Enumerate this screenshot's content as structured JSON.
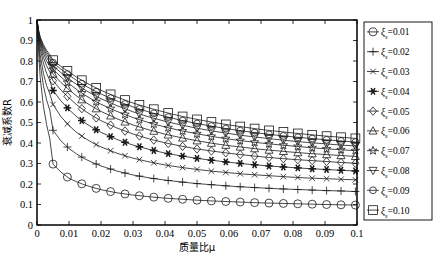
{
  "chart_data": {
    "type": "line",
    "title": "",
    "xlabel": "质量比μ",
    "ylabel": "衰减系数R",
    "xlim": [
      0,
      0.1
    ],
    "ylim": [
      0,
      1
    ],
    "grid": false,
    "legend_position": "right-outside",
    "x_ticks": [
      "0",
      "0.01",
      "0.02",
      "0.03",
      "0.04",
      "0.05",
      "0.06",
      "0.07",
      "0.08",
      "0.09",
      "0.1"
    ],
    "x_tick_values": [
      0,
      0.01,
      0.02,
      0.03,
      0.04,
      0.05,
      0.06,
      0.07,
      0.08,
      0.09,
      0.1
    ],
    "y_ticks": [
      "0",
      "0.1",
      "0.2",
      "0.3",
      "0.4",
      "0.5",
      "0.6",
      "0.7",
      "0.8",
      "0.9",
      "1"
    ],
    "y_tick_values": [
      0,
      0.1,
      0.2,
      0.3,
      0.4,
      0.5,
      0.6,
      0.7,
      0.8,
      0.9,
      1.0
    ],
    "x": [
      0,
      0.0005,
      0.001,
      0.002,
      0.003,
      0.004,
      0.005,
      0.0075,
      0.01,
      0.0125,
      0.015,
      0.0175,
      0.02,
      0.025,
      0.03,
      0.035,
      0.04,
      0.045,
      0.05,
      0.055,
      0.06,
      0.065,
      0.07,
      0.075,
      0.08,
      0.085,
      0.09,
      0.095,
      0.1
    ],
    "marker_x": [
      0.005,
      0.0095,
      0.014,
      0.0185,
      0.023,
      0.0275,
      0.032,
      0.0365,
      0.041,
      0.0455,
      0.05,
      0.0545,
      0.059,
      0.0635,
      0.068,
      0.0725,
      0.077,
      0.0815,
      0.086,
      0.0905,
      0.095,
      0.0995
    ],
    "series": [
      {
        "name": "ξs=0.01",
        "label_prefix": "ξ",
        "label_sub": "s",
        "label_suffix": "=0.01",
        "marker": "circle",
        "filled": false,
        "marker_size": 4.0,
        "values": [
          1.0,
          0.84,
          0.72,
          0.58,
          0.49,
          0.42,
          0.297,
          0.258,
          0.228,
          0.21,
          0.195,
          0.183,
          0.172,
          0.157,
          0.146,
          0.138,
          0.131,
          0.126,
          0.121,
          0.117,
          0.114,
          0.111,
          0.108,
          0.106,
          0.104,
          0.102,
          0.1,
          0.0985,
          0.097
        ]
      },
      {
        "name": "ξs=0.02",
        "label_prefix": "ξ",
        "label_sub": "s",
        "label_suffix": "=0.02",
        "marker": "plus",
        "filled": false,
        "marker_size": 4.0,
        "values": [
          1.0,
          0.88,
          0.79,
          0.68,
          0.61,
          0.56,
          0.462,
          0.41,
          0.373,
          0.345,
          0.322,
          0.304,
          0.288,
          0.263,
          0.244,
          0.23,
          0.219,
          0.21,
          0.202,
          0.196,
          0.19,
          0.185,
          0.181,
          0.177,
          0.174,
          0.171,
          0.168,
          0.166,
          0.163
        ]
      },
      {
        "name": "ξs=0.03",
        "label_prefix": "ξ",
        "label_sub": "s",
        "label_suffix": "=0.03",
        "marker": "xcross",
        "filled": false,
        "marker_size": 3.6,
        "values": [
          1.0,
          0.9,
          0.83,
          0.74,
          0.68,
          0.64,
          0.588,
          0.528,
          0.485,
          0.45,
          0.423,
          0.4,
          0.381,
          0.35,
          0.326,
          0.308,
          0.293,
          0.281,
          0.271,
          0.262,
          0.255,
          0.248,
          0.243,
          0.238,
          0.233,
          0.229,
          0.226,
          0.223,
          0.22
        ]
      },
      {
        "name": "ξs=0.04",
        "label_prefix": "ξ",
        "label_sub": "s",
        "label_suffix": "=0.04",
        "marker": "star6",
        "filled": true,
        "marker_size": 3.8,
        "values": [
          1.0,
          0.915,
          0.86,
          0.79,
          0.74,
          0.705,
          0.656,
          0.605,
          0.563,
          0.527,
          0.498,
          0.473,
          0.452,
          0.417,
          0.39,
          0.369,
          0.351,
          0.337,
          0.325,
          0.315,
          0.306,
          0.298,
          0.291,
          0.285,
          0.28,
          0.275,
          0.271,
          0.267,
          0.263
        ]
      },
      {
        "name": "ξs=0.05",
        "label_prefix": "ξ",
        "label_sub": "s",
        "label_suffix": "=0.05",
        "marker": "diamond",
        "filled": false,
        "marker_size": 4.2,
        "values": [
          1.0,
          0.925,
          0.878,
          0.818,
          0.777,
          0.747,
          0.704,
          0.658,
          0.62,
          0.585,
          0.556,
          0.531,
          0.509,
          0.473,
          0.444,
          0.42,
          0.401,
          0.385,
          0.371,
          0.36,
          0.35,
          0.341,
          0.333,
          0.326,
          0.32,
          0.315,
          0.31,
          0.305,
          0.301
        ]
      },
      {
        "name": "ξs=0.06",
        "label_prefix": "ξ",
        "label_sub": "s",
        "label_suffix": "=0.06",
        "marker": "triangle-up",
        "filled": false,
        "marker_size": 4.2,
        "values": [
          1.0,
          0.932,
          0.89,
          0.838,
          0.8,
          0.774,
          0.736,
          0.695,
          0.66,
          0.628,
          0.6,
          0.576,
          0.554,
          0.518,
          0.488,
          0.464,
          0.443,
          0.426,
          0.411,
          0.398,
          0.387,
          0.378,
          0.369,
          0.362,
          0.355,
          0.349,
          0.344,
          0.339,
          0.334
        ]
      },
      {
        "name": "ξs=0.07",
        "label_prefix": "ξ",
        "label_sub": "s",
        "label_suffix": "=0.07",
        "marker": "star5",
        "filled": false,
        "marker_size": 4.4,
        "values": [
          1.0,
          0.938,
          0.899,
          0.852,
          0.818,
          0.793,
          0.759,
          0.722,
          0.689,
          0.66,
          0.633,
          0.61,
          0.589,
          0.554,
          0.524,
          0.499,
          0.478,
          0.46,
          0.445,
          0.431,
          0.419,
          0.409,
          0.4,
          0.392,
          0.385,
          0.378,
          0.372,
          0.367,
          0.362
        ]
      },
      {
        "name": "ξs=0.08",
        "label_prefix": "ξ",
        "label_sub": "s",
        "label_suffix": "=0.08",
        "marker": "triangle-down",
        "filled": false,
        "marker_size": 4.2,
        "values": [
          1.0,
          0.943,
          0.906,
          0.863,
          0.832,
          0.808,
          0.777,
          0.743,
          0.712,
          0.684,
          0.659,
          0.636,
          0.616,
          0.582,
          0.552,
          0.527,
          0.506,
          0.488,
          0.472,
          0.458,
          0.446,
          0.435,
          0.426,
          0.417,
          0.409,
          0.402,
          0.396,
          0.39,
          0.385
        ]
      },
      {
        "name": "ξs=0.09",
        "label_prefix": "ξ",
        "label_sub": "s",
        "label_suffix": "=0.09",
        "marker": "circle-small",
        "filled": false,
        "marker_size": 3.4,
        "values": [
          1.0,
          0.947,
          0.912,
          0.872,
          0.843,
          0.821,
          0.792,
          0.76,
          0.731,
          0.704,
          0.68,
          0.658,
          0.639,
          0.605,
          0.576,
          0.551,
          0.53,
          0.511,
          0.495,
          0.481,
          0.468,
          0.457,
          0.447,
          0.438,
          0.43,
          0.423,
          0.416,
          0.41,
          0.404
        ]
      },
      {
        "name": "ξs=0.10",
        "label_prefix": "ξ",
        "label_sub": "s",
        "label_suffix": "=0.10",
        "marker": "square",
        "filled": false,
        "marker_size": 4.4,
        "values": [
          1.0,
          0.95,
          0.918,
          0.88,
          0.852,
          0.831,
          0.804,
          0.774,
          0.746,
          0.72,
          0.697,
          0.676,
          0.657,
          0.624,
          0.595,
          0.571,
          0.55,
          0.531,
          0.515,
          0.501,
          0.488,
          0.477,
          0.466,
          0.457,
          0.449,
          0.441,
          0.434,
          0.428,
          0.422
        ]
      }
    ]
  },
  "axis": {
    "xlabel": "质量比μ",
    "ylabel": "衰减系数R"
  }
}
